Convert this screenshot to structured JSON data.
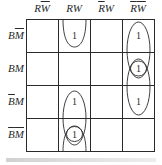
{
  "kmap": {
    "columns": [
      {
        "var1": "R",
        "var1_bar": false,
        "var2": "W",
        "var2_bar": true
      },
      {
        "var1": "R",
        "var1_bar": false,
        "var2": "W",
        "var2_bar": false
      },
      {
        "var1": "R",
        "var1_bar": true,
        "var2": "W",
        "var2_bar": false
      },
      {
        "var1": "R",
        "var1_bar": true,
        "var2": "W",
        "var2_bar": true
      }
    ],
    "rows": [
      {
        "var1": "B",
        "var1_bar": false,
        "var2": "M",
        "var2_bar": true
      },
      {
        "var1": "B",
        "var1_bar": false,
        "var2": "M",
        "var2_bar": false
      },
      {
        "var1": "B",
        "var1_bar": true,
        "var2": "M",
        "var2_bar": false
      },
      {
        "var1": "B",
        "var1_bar": true,
        "var2": "M",
        "var2_bar": true
      }
    ],
    "cells": [
      [
        "",
        "1",
        "",
        "1"
      ],
      [
        "",
        "",
        "",
        "1"
      ],
      [
        "",
        "1",
        "",
        "1"
      ],
      [
        "",
        "1",
        "",
        ""
      ]
    ],
    "groupings": [
      {
        "column": 1,
        "rows": [
          3,
          0
        ],
        "type": "wrap-around"
      },
      {
        "column": 1,
        "rows": [
          2,
          3
        ],
        "type": "oval"
      },
      {
        "column": 1,
        "rows": [
          3
        ],
        "type": "circle"
      },
      {
        "column": 3,
        "rows": [
          0,
          1
        ],
        "type": "oval"
      },
      {
        "column": 3,
        "rows": [
          1,
          2
        ],
        "type": "oval"
      },
      {
        "column": 3,
        "rows": [
          1
        ],
        "type": "circle"
      }
    ],
    "line_color": "#2a2a2a"
  }
}
